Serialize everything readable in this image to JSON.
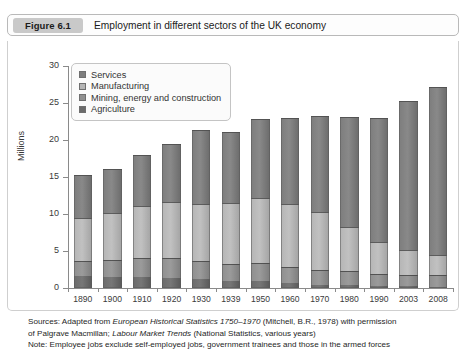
{
  "figure": {
    "pill_label": "Figure 6.1",
    "title": "Employment in different sectors of the UK economy"
  },
  "footer": {
    "sources_line1_a": "Sources: Adapted from ",
    "sources_line1_i": "European Historical Statistics 1750–1970",
    "sources_line1_b": " (Mitchell, B.R., 1978) with permission",
    "sources_line2_a": "of Palgrave Macmillan; ",
    "sources_line2_i": "Labour Market Trends",
    "sources_line2_b": " (National Statistics, various years)",
    "note_line": "Note: Employee jobs exclude self-employed jobs, government trainees and those in the armed forces"
  },
  "colors": {
    "services": "#7d7d7d",
    "manufacturing": "#b5b5b5",
    "mining_energy_construction": "#8f8f8f",
    "agriculture": "#6b6b6b",
    "axis": "#8a8a8a",
    "frame": "#cfcfcf",
    "pill": "#c9c9c9"
  },
  "chart_data": {
    "type": "bar",
    "title": "Employment in different sectors of the UK economy",
    "xlabel": "",
    "ylabel": "Millions",
    "ylim": [
      0,
      30
    ],
    "yticks": [
      0,
      5,
      10,
      15,
      20,
      25,
      30
    ],
    "grid": false,
    "stacked": true,
    "legend_position": "top-left",
    "categories": [
      "1890",
      "1900",
      "1910",
      "1920",
      "1930",
      "1939",
      "1950",
      "1960",
      "1970",
      "1980",
      "1990",
      "2003",
      "2008"
    ],
    "series": [
      {
        "name": "Agriculture",
        "color": "#6b6b6b",
        "values": [
          1.6,
          1.5,
          1.5,
          1.4,
          1.2,
          1.0,
          0.9,
          0.7,
          0.4,
          0.35,
          0.3,
          0.25,
          0.2
        ]
      },
      {
        "name": "Mining, energy and construction",
        "color": "#8f8f8f",
        "values": [
          2.1,
          2.3,
          2.5,
          2.6,
          2.4,
          2.3,
          2.5,
          2.2,
          2.0,
          1.9,
          1.6,
          1.55,
          1.5
        ]
      },
      {
        "name": "Manufacturing",
        "color": "#b5b5b5",
        "values": [
          5.7,
          6.3,
          7.1,
          7.6,
          7.7,
          8.2,
          8.7,
          8.4,
          7.9,
          6.0,
          4.3,
          3.3,
          2.8
        ]
      },
      {
        "name": "Services",
        "color": "#7d7d7d",
        "values": [
          5.9,
          6.0,
          6.9,
          7.9,
          10.1,
          9.6,
          10.8,
          11.7,
          12.9,
          14.8,
          16.8,
          20.2,
          22.6
        ]
      }
    ],
    "totals": [
      15.3,
      16.1,
      18.0,
      19.5,
      21.4,
      21.1,
      22.9,
      23.0,
      23.2,
      23.05,
      23.0,
      25.3,
      27.1
    ]
  }
}
